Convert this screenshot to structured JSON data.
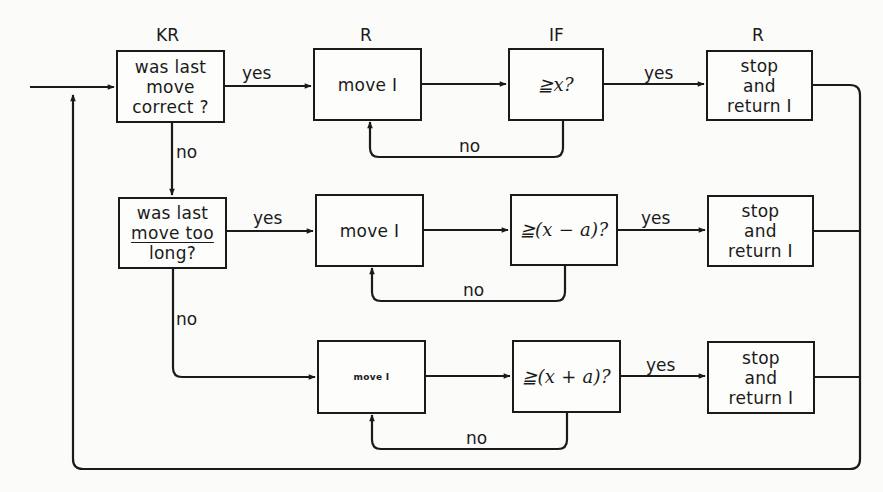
{
  "diagram": {
    "column_headers": {
      "col1": "KR",
      "col2": "R",
      "col3": "IF",
      "col4": "R"
    },
    "rows": [
      {
        "decision": [
          "was last",
          "move",
          "correct ?"
        ],
        "action": "move I",
        "condition": "≧x?",
        "result": [
          "stop",
          "and",
          "return I"
        ],
        "yes_label_decision": "yes",
        "yes_label_condition": "yes",
        "no_loop_label": "no"
      },
      {
        "decision": [
          "was last",
          "move too",
          "long?"
        ],
        "action": "move I",
        "condition": "≧(x − a)?",
        "result": [
          "stop",
          "and",
          "return I"
        ],
        "yes_label_decision": "yes",
        "yes_label_condition": "yes",
        "no_loop_label": "no"
      },
      {
        "action": "move I",
        "condition": "≧(x + a)?",
        "result": [
          "stop",
          "and",
          "return I"
        ],
        "yes_label_condition": "yes",
        "no_loop_label": "no"
      }
    ],
    "branch_labels": {
      "row1_to_row2": "no",
      "row2_to_row3": "no"
    },
    "colors": {
      "ink": "#1a1a1a",
      "paper": "#fbfbfa"
    }
  }
}
